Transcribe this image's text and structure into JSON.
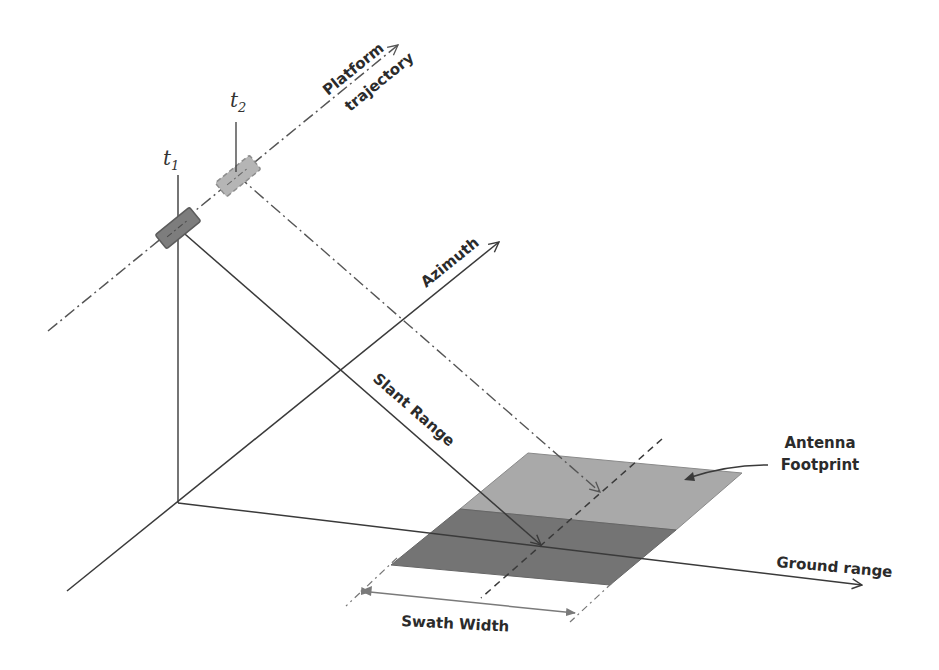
{
  "diagram": {
    "labels": {
      "platform_trajectory_line1": "Platform",
      "platform_trajectory_line2": "trajectory",
      "azimuth": "Azimuth",
      "slant_range": "Slant Range",
      "antenna_footprint_line1": "Antenna",
      "antenna_footprint_line2": "Footprint",
      "ground_range": "Ground range",
      "swath_width": "Swath Width",
      "t1_base": "t",
      "t1_sub": "1",
      "t2_base": "t",
      "t2_sub": "2"
    },
    "colors": {
      "line": "#3a3a3a",
      "dashdot": "#555555",
      "platform_fill": "#7d7d7d",
      "platform_ghost_fill": "#b5b5b5",
      "footprint_light": "#a9a9a9",
      "footprint_dark": "#747474",
      "swath_arrow": "#7a7a7a"
    }
  }
}
